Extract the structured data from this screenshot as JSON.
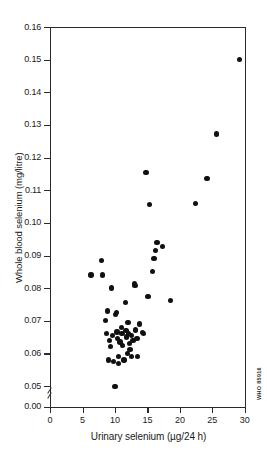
{
  "figure": {
    "credit_code": "WHO 85916"
  },
  "chart_data": {
    "type": "scatter",
    "title": "",
    "xlabel": "Urinary selenium (µg/24 h)",
    "ylabel": "Whole blood selenium (mg/litre)",
    "xlim": [
      0,
      30
    ],
    "ylim": [
      0.0,
      0.16
    ],
    "y_axis_break": true,
    "y_break_between": [
      0.0,
      0.05
    ],
    "grid": false,
    "legend": null,
    "xticks": [
      0,
      5,
      10,
      15,
      20,
      25,
      30
    ],
    "xticklabels": [
      "0",
      "5",
      "10",
      "15",
      "20",
      "25",
      "30"
    ],
    "yticks": [
      0.0,
      0.05,
      0.06,
      0.07,
      0.08,
      0.09,
      0.1,
      0.11,
      0.12,
      0.13,
      0.14,
      0.15,
      0.16
    ],
    "yticklabels": [
      "0.00",
      "0.05",
      "0.06",
      "0.07",
      "0.08",
      "0.09",
      "0.10",
      "0.11",
      "0.12",
      "0.13",
      "0.14",
      "0.15",
      "0.16"
    ],
    "marker": "filled-circle",
    "marker_color": "#111111",
    "n_points": 55,
    "points": [
      [
        6.3,
        0.084
      ],
      [
        7.9,
        0.0885
      ],
      [
        8.1,
        0.084
      ],
      [
        8.6,
        0.07
      ],
      [
        8.7,
        0.066
      ],
      [
        8.9,
        0.073
      ],
      [
        9.0,
        0.058
      ],
      [
        9.2,
        0.064
      ],
      [
        9.3,
        0.062
      ],
      [
        9.5,
        0.08
      ],
      [
        9.6,
        0.0655
      ],
      [
        9.8,
        0.0575
      ],
      [
        10.0,
        0.0498
      ],
      [
        10.1,
        0.072
      ],
      [
        10.2,
        0.0725
      ],
      [
        10.3,
        0.0665
      ],
      [
        10.4,
        0.0645
      ],
      [
        10.5,
        0.059
      ],
      [
        10.6,
        0.057
      ],
      [
        10.8,
        0.0635
      ],
      [
        11.0,
        0.068
      ],
      [
        11.1,
        0.066
      ],
      [
        11.2,
        0.0625
      ],
      [
        11.4,
        0.058
      ],
      [
        11.6,
        0.0755
      ],
      [
        11.7,
        0.067
      ],
      [
        11.8,
        0.065
      ],
      [
        11.9,
        0.06
      ],
      [
        12.0,
        0.0695
      ],
      [
        12.1,
        0.066
      ],
      [
        12.2,
        0.063
      ],
      [
        12.3,
        0.0612
      ],
      [
        12.5,
        0.059
      ],
      [
        12.6,
        0.0655
      ],
      [
        12.8,
        0.064
      ],
      [
        13.0,
        0.0815
      ],
      [
        13.1,
        0.0808
      ],
      [
        13.2,
        0.0672
      ],
      [
        13.4,
        0.0645
      ],
      [
        13.5,
        0.059
      ],
      [
        13.8,
        0.069
      ],
      [
        14.2,
        0.0663
      ],
      [
        14.4,
        0.066
      ],
      [
        14.8,
        0.1155
      ],
      [
        15.1,
        0.0775
      ],
      [
        15.3,
        0.1057
      ],
      [
        15.8,
        0.085
      ],
      [
        16.0,
        0.089
      ],
      [
        16.2,
        0.0915
      ],
      [
        16.5,
        0.094
      ],
      [
        17.3,
        0.0928
      ],
      [
        18.6,
        0.0763
      ],
      [
        22.4,
        0.106
      ],
      [
        24.2,
        0.1135
      ],
      [
        25.6,
        0.1272
      ],
      [
        29.2,
        0.15
      ]
    ]
  }
}
